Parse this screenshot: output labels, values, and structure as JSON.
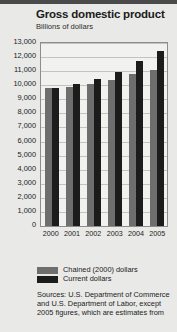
{
  "chart_data": {
    "type": "bar",
    "title": "Gross domestic product",
    "subtitle": "Billions of dollars",
    "xlabel": "",
    "ylabel": "",
    "ylim": [
      0,
      13000
    ],
    "grid": true,
    "legend_position": "bottom",
    "categories": [
      "2000",
      "2001",
      "2002",
      "2003",
      "2004",
      "2005"
    ],
    "ytick_labels": [
      "13,000",
      "12,000",
      "11,000",
      "10,000",
      "9,000",
      "8,000",
      "7,000",
      "6,000",
      "5,000",
      "4,000",
      "3,000",
      "2,000",
      "1,000",
      "0"
    ],
    "ytick_values": [
      13000,
      12000,
      11000,
      10000,
      9000,
      8000,
      7000,
      6000,
      5000,
      4000,
      3000,
      2000,
      1000,
      0
    ],
    "series": [
      {
        "name": "Chained (2000) dollars",
        "color": "#6e6e6e",
        "values": [
          9800,
          9900,
          10100,
          10400,
          10800,
          11100
        ]
      },
      {
        "name": "Current dollars",
        "color": "#1c1c1c",
        "values": [
          9800,
          10100,
          10450,
          10950,
          11700,
          12450
        ]
      }
    ],
    "source": "Sources: U.S. Department of Commerce and U.S. Department of Labor, except 2005 figures, which are estimates from"
  }
}
